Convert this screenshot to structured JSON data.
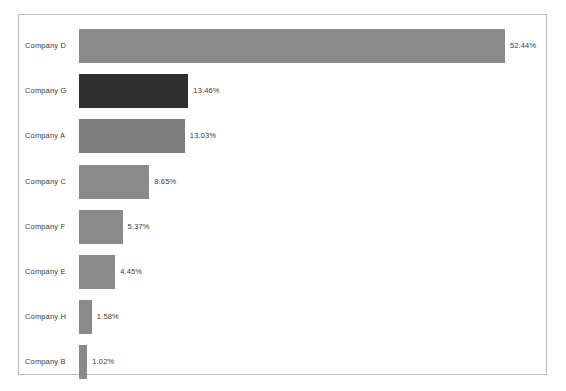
{
  "chart_data": {
    "type": "bar",
    "orientation": "horizontal",
    "title": "",
    "subtitle": "",
    "xlabel": "",
    "ylabel": "",
    "grid": false,
    "legend": false,
    "axis_visible": false,
    "xlim": [
      0,
      57.5
    ],
    "categories": [
      "Company D",
      "Company G",
      "Company A",
      "Company C",
      "Company F",
      "Company E",
      "Company H",
      "Company B"
    ],
    "values": [
      52.44,
      13.46,
      13.03,
      8.65,
      5.37,
      4.45,
      1.58,
      1.02
    ],
    "value_labels": [
      "52.44%",
      "13.46%",
      "13.03%",
      "8.65%",
      "5.37%",
      "4.45%",
      "1.58%",
      "1.02%"
    ],
    "bar_colors": [
      "#8a8a8a",
      "#303030",
      "#7d7d7d",
      "#8a8a8a",
      "#8a8a8a",
      "#8a8a8a",
      "#8a8a8a",
      "#8a8a8a"
    ]
  },
  "frame": {
    "border_color": "#b9b9b9",
    "background": "#ffffff"
  },
  "series": [
    {
      "category": "Company D",
      "value": 52.44,
      "label": "52.44%",
      "color": "#8a8a8a"
    },
    {
      "category": "Company G",
      "value": 13.46,
      "label": "13.46%",
      "color": "#303030"
    },
    {
      "category": "Company A",
      "value": 13.03,
      "label": "13.03%",
      "color": "#7d7d7d"
    },
    {
      "category": "Company C",
      "value": 8.65,
      "label": "8.65%",
      "color": "#8a8a8a"
    },
    {
      "category": "Company F",
      "value": 5.37,
      "label": "5.37%",
      "color": "#8a8a8a"
    },
    {
      "category": "Company E",
      "value": 4.45,
      "label": "4.45%",
      "color": "#8a8a8a"
    },
    {
      "category": "Company H",
      "value": 1.58,
      "label": "1.58%",
      "color": "#8a8a8a"
    },
    {
      "category": "Company B",
      "value": 1.02,
      "label": "1.02%",
      "color": "#8a8a8a"
    }
  ]
}
